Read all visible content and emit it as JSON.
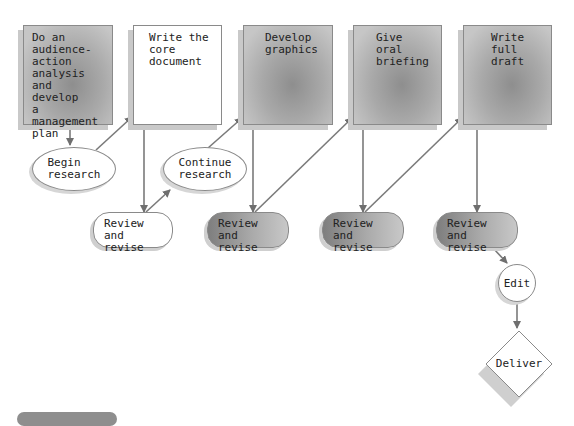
{
  "diagram": {
    "type": "flowchart",
    "steps": [
      {
        "id": "plan",
        "label": "Do an\naudience-\naction\nanalysis and\ndevelop\na management\nplan",
        "shape": "rect",
        "fill": "gray"
      },
      {
        "id": "core",
        "label": "Write the\ncore\ndocument",
        "shape": "rect",
        "fill": "white"
      },
      {
        "id": "graphics",
        "label": "Develop\ngraphics",
        "shape": "rect",
        "fill": "gray"
      },
      {
        "id": "briefing",
        "label": "Give\noral\nbriefing",
        "shape": "rect",
        "fill": "gray"
      },
      {
        "id": "draft",
        "label": "Write\nfull\ndraft",
        "shape": "rect",
        "fill": "gray"
      }
    ],
    "ellipses": [
      {
        "id": "begin",
        "label": "Begin\nresearch"
      },
      {
        "id": "continue",
        "label": "Continue\nresearch"
      }
    ],
    "reviews": [
      {
        "id": "review1",
        "label": "Review and\nrevise",
        "fill": "white"
      },
      {
        "id": "review2",
        "label": "Review and\nrevise",
        "fill": "gray"
      },
      {
        "id": "review3",
        "label": "Review and\nrevise",
        "fill": "gray"
      },
      {
        "id": "review4",
        "label": "Review and\nrevise",
        "fill": "gray"
      }
    ],
    "edit": {
      "label": "Edit",
      "shape": "circle"
    },
    "deliver": {
      "label": "Deliver",
      "shape": "diamond"
    }
  },
  "colors": {
    "line": "#7a7a7a",
    "border": "#8a8a8a",
    "shadow": "#c9c9c9",
    "gray_fill": "#a9a9a9"
  }
}
